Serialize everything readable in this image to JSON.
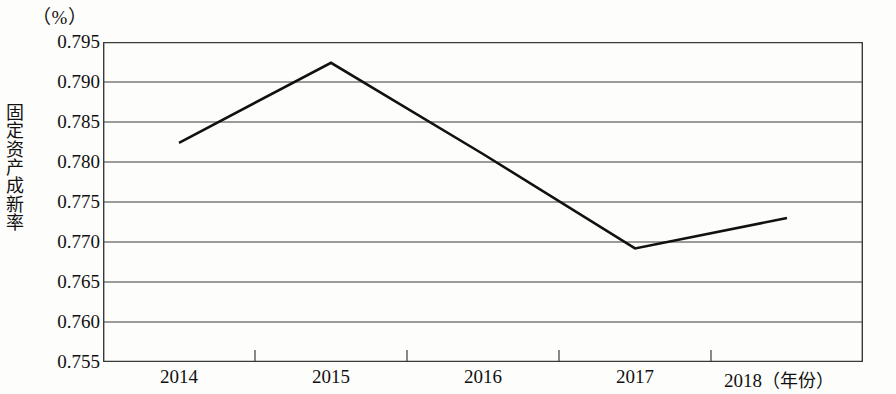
{
  "chart_data": {
    "type": "line",
    "title": "",
    "unit_label": "（%）",
    "xlabel": "",
    "x_axis_unit": "（年份）",
    "ylabel": "固定资产成新率",
    "categories": [
      "2014",
      "2015",
      "2016",
      "2017",
      "2018"
    ],
    "values": [
      0.7824,
      0.7924,
      0.781,
      0.7692,
      0.773
    ],
    "series": [
      {
        "name": "固定资产成新率",
        "values": [
          0.7824,
          0.7924,
          0.781,
          0.7692,
          0.773
        ]
      }
    ],
    "ylim": [
      0.755,
      0.795
    ],
    "ytick_labels": [
      "0.795",
      "0.790",
      "0.785",
      "0.780",
      "0.775",
      "0.770",
      "0.765",
      "0.760",
      "0.755"
    ],
    "ytick_values": [
      0.795,
      0.79,
      0.785,
      0.78,
      0.775,
      0.77,
      0.765,
      0.76,
      0.755
    ],
    "ytick_step": 0.005,
    "grid": "horizontal",
    "legend": "none",
    "line_color": "#111111",
    "grid_color": "#3a3a3a",
    "markers": "none"
  },
  "axis": {
    "y_title_chars": [
      "固",
      "定",
      "资",
      "产",
      "成",
      "新",
      "率"
    ]
  }
}
